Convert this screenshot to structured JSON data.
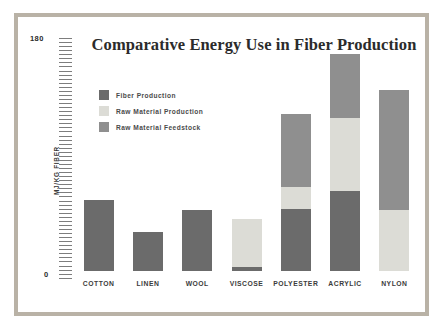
{
  "chart_data": {
    "type": "bar",
    "subtype": "stacked-bar",
    "title": "Comparative Energy Use in Fiber Production",
    "xlabel": "",
    "ylabel": "MJ/KG FIBER",
    "ylim": [
      0,
      180
    ],
    "yticks": [
      "0",
      "180"
    ],
    "grid": false,
    "legend_position": "inside-upper-left",
    "categories": [
      "COTTON",
      "LINEN",
      "WOOL",
      "VISCOSE",
      "POLYESTER",
      "ACRYLIC",
      "NYLON"
    ],
    "series": [
      {
        "name": "Fiber Production",
        "color": "#6b6b6b",
        "values": [
          55,
          30,
          47,
          3,
          48,
          62,
          0
        ]
      },
      {
        "name": "Raw Material Production",
        "color": "#dcdcd6",
        "values": [
          0,
          0,
          0,
          37,
          17,
          56,
          47
        ]
      },
      {
        "name": "Raw Material Feedstock",
        "color": "#8f8f8f",
        "values": [
          0,
          0,
          0,
          0,
          56,
          50,
          93
        ]
      }
    ],
    "totals": [
      55,
      30,
      47,
      40,
      121,
      168,
      140
    ],
    "stack_order_bottom_to_top": [
      "Fiber Production",
      "Raw Material Production",
      "Raw Material Feedstock"
    ],
    "tick_count": 60
  },
  "legend": {
    "items": [
      {
        "label": "Fiber Production"
      },
      {
        "label": "Raw Material Production"
      },
      {
        "label": "Raw Material Feedstock"
      }
    ]
  },
  "frame": {
    "border_color": "#b9b2a6",
    "background": "#ffffff"
  }
}
